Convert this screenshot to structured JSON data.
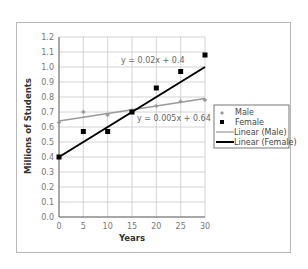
{
  "chart_data": {
    "type": "scatter",
    "title": "",
    "xlabel": "Years",
    "ylabel": "Millions of Students",
    "xlim": [
      0,
      30
    ],
    "ylim": [
      0.0,
      1.2
    ],
    "x_ticks": [
      "0",
      "5",
      "10",
      "15",
      "20",
      "25",
      "30"
    ],
    "y_ticks": [
      "0.0",
      "0.1",
      "0.2",
      "0.3",
      "0.4",
      "0.5",
      "0.6",
      "0.7",
      "0.8",
      "0.9",
      "1.0",
      "1.1",
      "1.2"
    ],
    "grid": true,
    "legend_position": "right",
    "x": [
      0,
      5,
      10,
      15,
      20,
      25,
      30
    ],
    "series": [
      {
        "name": "Male",
        "marker": "diamond",
        "color": "#999999",
        "values": [
          0.63,
          0.7,
          0.68,
          0.71,
          0.74,
          0.77,
          0.78
        ]
      },
      {
        "name": "Female",
        "marker": "square",
        "color": "#000000",
        "values": [
          0.4,
          0.57,
          0.57,
          0.7,
          0.86,
          0.97,
          1.08
        ]
      }
    ],
    "trendlines": [
      {
        "name": "Linear (Male)",
        "color": "#999999",
        "slope": 0.005,
        "intercept": 0.64,
        "equation": "y = 0.005x + 0.64"
      },
      {
        "name": "Linear (Female)",
        "color": "#000000",
        "slope": 0.02,
        "intercept": 0.4,
        "equation": "y = 0.02x + 0.4"
      }
    ],
    "annotations": [
      "y = 0.02x + 0.4",
      "y = 0.005x + 0.64"
    ]
  },
  "labels": {
    "xlabel": "Years",
    "ylabel": "Millions of Students",
    "eq_female": "y = 0.02x + 0.4",
    "eq_male": "y = 0.005x + 0.64",
    "legend": [
      "Male",
      "Female",
      "Linear (Male)",
      "Linear (Female)"
    ]
  }
}
